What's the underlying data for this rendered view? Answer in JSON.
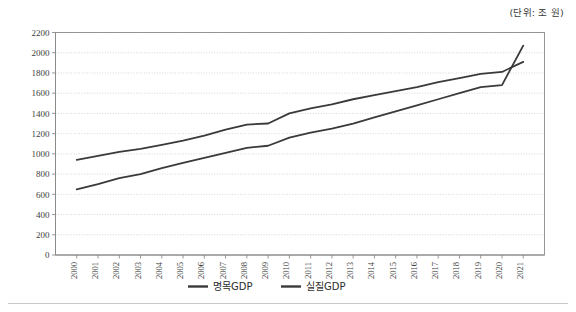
{
  "unit_note": "(단위: 조 원)",
  "chart_data": {
    "type": "line",
    "title": "",
    "xlabel": "",
    "ylabel": "",
    "ylim": [
      0,
      2200
    ],
    "ytick_step": 200,
    "yticks": [
      0,
      200,
      400,
      600,
      800,
      1000,
      1200,
      1400,
      1600,
      1800,
      2000,
      2200
    ],
    "grid": true,
    "legend_position": "bottom-center",
    "categories": [
      "2000",
      "2001",
      "2002",
      "2003",
      "2004",
      "2005",
      "2006",
      "2007",
      "2008",
      "2009",
      "2010",
      "2011",
      "2012",
      "2013",
      "2014",
      "2015",
      "2016",
      "2017",
      "2018",
      "2019",
      "2020",
      "2021"
    ],
    "series": [
      {
        "name": "명목GDP",
        "color": "#3a3a3a",
        "values": [
          940,
          980,
          1020,
          1050,
          1090,
          1130,
          1180,
          1240,
          1290,
          1300,
          1400,
          1450,
          1490,
          1540,
          1580,
          1620,
          1660,
          1710,
          1750,
          1790,
          1810,
          1910
        ]
      },
      {
        "name": "실질GDP",
        "color": "#3a3a3a",
        "values": [
          650,
          700,
          760,
          800,
          860,
          910,
          960,
          1010,
          1060,
          1080,
          1160,
          1210,
          1250,
          1300,
          1360,
          1420,
          1480,
          1540,
          1600,
          1660,
          1680,
          2070
        ]
      }
    ]
  },
  "legend": {
    "items": [
      {
        "label": "명목GDP"
      },
      {
        "label": "실질GDP"
      }
    ]
  }
}
